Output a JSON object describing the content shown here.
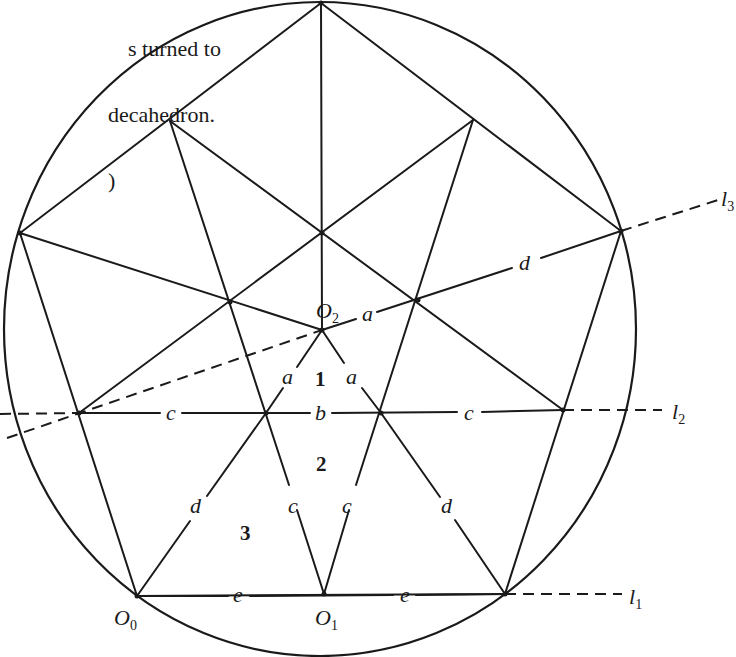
{
  "caption": {
    "lines": [
      "s turned to",
      "decahedron.",
      ")"
    ]
  },
  "figure": {
    "points": {
      "O0": {
        "label": "O",
        "sub": "0"
      },
      "O1": {
        "label": "O",
        "sub": "1"
      },
      "O2": {
        "label": "O",
        "sub": "2"
      }
    },
    "lines": {
      "l1": {
        "label": "l",
        "sub": "1"
      },
      "l2": {
        "label": "l",
        "sub": "2"
      },
      "l3": {
        "label": "l",
        "sub": "3"
      }
    },
    "segment_labels": {
      "a_left": "a",
      "a_right": "a",
      "a_top": "a",
      "b": "b",
      "c_left": "c",
      "c_right": "c",
      "c_inner_left": "c",
      "c_inner_right": "c",
      "d_left": "d",
      "d_right": "d",
      "d_top": "d",
      "e_left": "e",
      "e_right": "e"
    },
    "regions": {
      "r1": "1",
      "r2": "2",
      "r3": "3"
    }
  }
}
